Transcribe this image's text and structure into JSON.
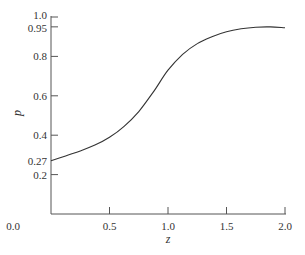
{
  "chart_data": {
    "type": "line",
    "title": "",
    "xlabel": "z",
    "ylabel": "p",
    "xlim": [
      0.0,
      2.0
    ],
    "ylim": [
      0.0,
      1.0
    ],
    "grid": false,
    "legend": null,
    "x_ticks": [
      {
        "value": 0.0,
        "label": "0.0"
      },
      {
        "value": 0.5,
        "label": "0.5"
      },
      {
        "value": 1.0,
        "label": "1.0"
      },
      {
        "value": 1.5,
        "label": "1.5"
      },
      {
        "value": 2.0,
        "label": "2.0"
      }
    ],
    "y_ticks": [
      {
        "value": 0.0,
        "label": "0.0"
      },
      {
        "value": 0.2,
        "label": "0.2"
      },
      {
        "value": 0.27,
        "label": "0.27"
      },
      {
        "value": 0.4,
        "label": "0.4"
      },
      {
        "value": 0.6,
        "label": "0.6"
      },
      {
        "value": 0.8,
        "label": "0.8"
      },
      {
        "value": 0.95,
        "label": "0.95"
      },
      {
        "value": 1.0,
        "label": "1.0"
      }
    ],
    "series": [
      {
        "name": "p(z)",
        "x": [
          0.0,
          0.125,
          0.25,
          0.375,
          0.5,
          0.625,
          0.75,
          0.875,
          1.0,
          1.125,
          1.25,
          1.375,
          1.5,
          1.625,
          1.75,
          1.875,
          2.0
        ],
        "y": [
          0.27,
          0.295,
          0.32,
          0.35,
          0.39,
          0.445,
          0.52,
          0.62,
          0.73,
          0.81,
          0.865,
          0.9,
          0.925,
          0.94,
          0.948,
          0.95,
          0.945
        ]
      }
    ]
  }
}
